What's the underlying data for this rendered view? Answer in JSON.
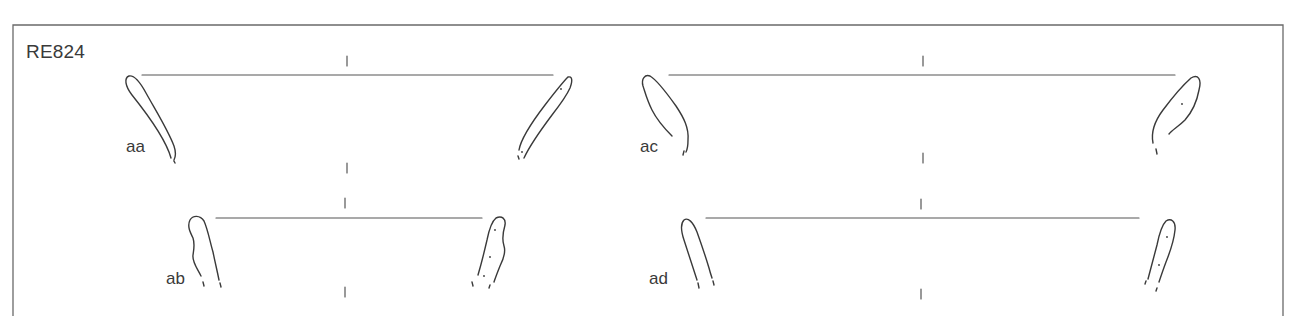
{
  "plate": {
    "id": "RE824",
    "stroke_color": "#3a3a3a",
    "frame_color": "#6a6a6a",
    "background": "#ffffff"
  },
  "vessels": [
    {
      "label": "aa",
      "position": "top-left"
    },
    {
      "label": "ab",
      "position": "bottom-left"
    },
    {
      "label": "ac",
      "position": "top-right"
    },
    {
      "label": "ad",
      "position": "bottom-right"
    }
  ]
}
